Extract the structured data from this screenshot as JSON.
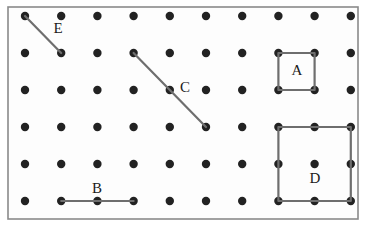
{
  "figure": {
    "background_color": "#ffffff"
  },
  "board": {
    "name": "geoboard",
    "frame": {
      "x": 8,
      "y": 7,
      "width": 350,
      "height": 212,
      "border_color": "#8a8a8a",
      "border_width": 1.6,
      "fill_color": "#fdfdfd"
    },
    "grid": {
      "columns": 10,
      "rows": 6,
      "origin_x": 25,
      "origin_y": 16,
      "spacing_x": 36.2,
      "spacing_y": 37.0,
      "dot_radius": 4.2,
      "dot_color": "#222222"
    }
  },
  "shapes": [
    {
      "id": "E",
      "label": "E",
      "type": "segment",
      "stroke_color": "#6e6e6e",
      "stroke_width": 2.2,
      "points": [
        [
          1,
          1
        ],
        [
          2,
          2
        ]
      ],
      "label_position": {
        "x": 58,
        "y": 30
      }
    },
    {
      "id": "C",
      "label": "C",
      "type": "segment",
      "stroke_color": "#6e6e6e",
      "stroke_width": 2.2,
      "points": [
        [
          4,
          2
        ],
        [
          6,
          4
        ]
      ],
      "label_position": {
        "x": 185,
        "y": 89
      }
    },
    {
      "id": "B",
      "label": "B",
      "type": "segment",
      "stroke_color": "#6e6e6e",
      "stroke_width": 2.2,
      "points": [
        [
          2,
          6
        ],
        [
          4,
          6
        ]
      ],
      "label_position": {
        "x": 97,
        "y": 190
      }
    },
    {
      "id": "A",
      "label": "A",
      "type": "square",
      "stroke_color": "#6e6e6e",
      "stroke_width": 2.2,
      "points": [
        [
          8,
          2
        ],
        [
          9,
          2
        ],
        [
          9,
          3
        ],
        [
          8,
          3
        ]
      ],
      "label_position": {
        "x": 297,
        "y": 72
      }
    },
    {
      "id": "D",
      "label": "D",
      "type": "square",
      "stroke_color": "#6e6e6e",
      "stroke_width": 2.2,
      "points": [
        [
          8,
          4
        ],
        [
          10,
          4
        ],
        [
          10,
          6
        ],
        [
          8,
          6
        ]
      ],
      "label_position": {
        "x": 315,
        "y": 180
      }
    }
  ]
}
